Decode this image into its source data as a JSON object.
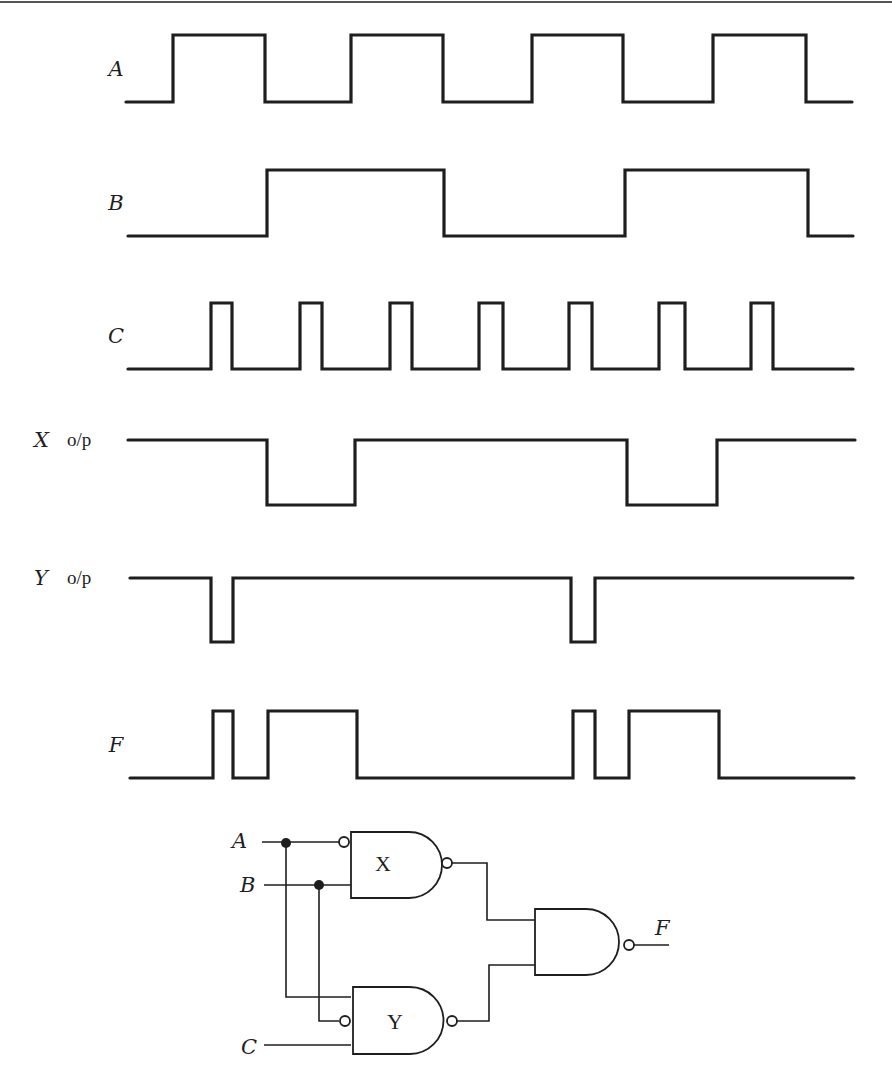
{
  "figure": {
    "type": "timing-diagram-with-logic-circuit",
    "signals": [
      {
        "name": "A",
        "suffix": "",
        "baseline_y": 102,
        "high_y": 35,
        "start_x": 126,
        "end_x": 852,
        "initial": "low",
        "transitions_x": [
          173,
          265,
          351,
          443,
          532,
          623,
          713,
          806
        ]
      },
      {
        "name": "B",
        "suffix": "",
        "baseline_y": 236,
        "high_y": 170,
        "start_x": 128,
        "end_x": 853,
        "initial": "low",
        "transitions_x": [
          267,
          444,
          625,
          808
        ]
      },
      {
        "name": "C",
        "suffix": "",
        "baseline_y": 369,
        "high_y": 303,
        "start_x": 128,
        "end_x": 853,
        "initial": "low",
        "transitions_x": [
          211,
          232,
          300,
          322,
          390,
          412,
          479,
          503,
          569,
          592,
          659,
          685,
          751,
          773
        ]
      },
      {
        "name": "X",
        "suffix": "o/p",
        "baseline_y": 505,
        "high_y": 440,
        "start_x": 128,
        "end_x": 855,
        "initial": "high",
        "transitions_x": [
          267,
          355,
          627,
          717
        ]
      },
      {
        "name": "Y",
        "suffix": "o/p",
        "baseline_y": 642,
        "high_y": 578,
        "start_x": 130,
        "end_x": 853,
        "initial": "high",
        "transitions_x": [
          211,
          233,
          571,
          595
        ]
      },
      {
        "name": "F",
        "suffix": "",
        "baseline_y": 778,
        "high_y": 711,
        "start_x": 130,
        "end_x": 854,
        "initial": "low",
        "transitions_x": [
          213,
          233,
          268,
          357,
          573,
          595,
          629,
          719
        ]
      }
    ],
    "circuit": {
      "inputs": [
        "A",
        "B",
        "C"
      ],
      "output": "F",
      "gates": [
        {
          "id": "X",
          "label": "X",
          "type": "NAND",
          "inputs": [
            "NOT A",
            "B"
          ]
        },
        {
          "id": "Y",
          "label": "Y",
          "type": "NAND",
          "inputs": [
            "A",
            "NOT B",
            "C"
          ]
        },
        {
          "id": "F",
          "label": "",
          "type": "NAND",
          "inputs": [
            "X",
            "Y"
          ]
        }
      ]
    }
  }
}
